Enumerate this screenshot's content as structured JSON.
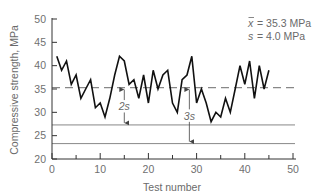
{
  "chart_data": {
    "type": "line",
    "title": "",
    "xlabel": "Test number",
    "ylabel": "Compressive strength, MPa",
    "xlim": [
      0,
      50
    ],
    "ylim": [
      20,
      50
    ],
    "x_ticks": [
      0,
      10,
      20,
      30,
      40,
      50
    ],
    "x_minor_ticks": [
      5,
      15,
      25,
      35,
      45
    ],
    "y_ticks": [
      20,
      25,
      30,
      35,
      40,
      45,
      50
    ],
    "grid": false,
    "legend": null,
    "series": [
      {
        "name": "Compressive strength",
        "x": [
          1,
          2,
          3,
          4,
          5,
          6,
          7,
          8,
          9,
          10,
          11,
          12,
          13,
          14,
          15,
          16,
          17,
          18,
          19,
          20,
          21,
          22,
          23,
          24,
          25,
          26,
          27,
          28,
          29,
          30,
          31,
          32,
          33,
          34,
          35,
          36,
          37,
          38,
          39,
          40,
          41,
          42,
          43,
          44,
          45
        ],
        "values": [
          42,
          39,
          41,
          36,
          38,
          33,
          35,
          37,
          31,
          32,
          29,
          33,
          38,
          42,
          41,
          36,
          37,
          33,
          38,
          32,
          39,
          35,
          38,
          39,
          32,
          30,
          37,
          38,
          42,
          32,
          35,
          32,
          28,
          30,
          29,
          33,
          30,
          35,
          40,
          36,
          41,
          33,
          40,
          35,
          39
        ]
      }
    ],
    "reference_lines": [
      {
        "name": "mean",
        "y": 35.3,
        "style": "dashed"
      },
      {
        "name": "mean-2s",
        "y": 27.3,
        "style": "solid"
      },
      {
        "name": "mean-3s",
        "y": 23.3,
        "style": "solid"
      }
    ],
    "annotations": [
      {
        "text": "2s",
        "x": 15,
        "from": 35.3,
        "to": 27.3
      },
      {
        "text": "3s",
        "x": 28.5,
        "from": 35.3,
        "to": 23.3
      }
    ],
    "stats": {
      "mean_label": "x̄ = 35.3 MPa",
      "sd_label": "s = 4.0 MPa"
    }
  },
  "labels": {
    "xlabel": "Test number",
    "ylabel": "Compressive strength, MPa",
    "mean_stat": "= 35.3 MPa",
    "mean_symbol": "x",
    "sd_symbol": "s",
    "sd_stat": "= 4.0 MPa",
    "ann_2s": "2s",
    "ann_3s": "3s"
  },
  "colors": {
    "line": "#111111",
    "axis": "#333333",
    "reference": "#888888",
    "text": "#6a6a6a"
  }
}
